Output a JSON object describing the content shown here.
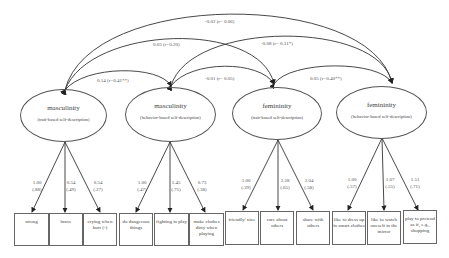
{
  "latents": [
    {
      "name": "masculinity",
      "sub": "(trait-based self-description)"
    },
    {
      "name": "masculinity",
      "sub": "(behavior-based self-description)"
    },
    {
      "name": "femininity",
      "sub": "(trait-based self-description)"
    },
    {
      "name": "femininity",
      "sub": "(behavior-based self-description)"
    }
  ],
  "correlations": [
    {
      "from": 0,
      "to": 3,
      "label": "-0.02 (r= 0.06)"
    },
    {
      "from": 0,
      "to": 2,
      "label": "0.03 (r=0.20)"
    },
    {
      "from": 1,
      "to": 3,
      "label": "-0.08 (r= 0.31*)"
    },
    {
      "from": 0,
      "to": 1,
      "label": "0.14 (r=0.41**)"
    },
    {
      "from": 1,
      "to": 2,
      "label": "-0.01 (r= 0.05)"
    },
    {
      "from": 2,
      "to": 3,
      "label": "0.05 (r=0.40**)"
    }
  ],
  "loadings": [
    {
      "value": "1.00",
      "std": "(.88)"
    },
    {
      "value": "0.54",
      "std": "(.49)"
    },
    {
      "value": "0.54",
      "std": "(.27)"
    },
    {
      "value": "1.00",
      "std": "(.47)"
    },
    {
      "value": "1.45",
      "std": "(.75)"
    },
    {
      "value": "0.73",
      "std": "(.38)"
    },
    {
      "value": "1.00",
      "std": "(.39)"
    },
    {
      "value": "2.28",
      "std": "(.65)"
    },
    {
      "value": "2.04",
      "std": "(.58)"
    },
    {
      "value": "1.00",
      "std": "(.57)"
    },
    {
      "value": "1.07",
      "std": "(.55)"
    },
    {
      "value": "1.51",
      "std": "(.71)"
    }
  ],
  "indicators": [
    "strong",
    "brave",
    "crying when hurt (-)",
    "do dangerous things",
    "fighting in play",
    "make clothes dirty when playing",
    "friendly/ nice",
    "care about others",
    "share with others",
    "like to dress up in smart clothes",
    "like to watch oneself in the mirror",
    "play to pretend as if, e.g., shopping"
  ]
}
